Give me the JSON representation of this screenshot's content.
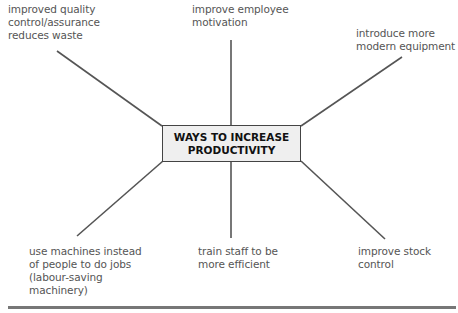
{
  "center": {
    "line1": "WAYS TO INCREASE",
    "line2": "PRODUCTIVITY"
  },
  "branches": [
    {
      "id": "top-left",
      "lines": [
        "improved quality",
        "control/assurance",
        "reduces waste"
      ]
    },
    {
      "id": "top-center",
      "lines": [
        "improve employee",
        "motivation"
      ]
    },
    {
      "id": "top-right",
      "lines": [
        "introduce more",
        "modern equipment"
      ]
    },
    {
      "id": "bottom-left",
      "lines": [
        "use machines instead",
        "of people to do jobs",
        "(labour-saving",
        "machinery)"
      ]
    },
    {
      "id": "bottom-center",
      "lines": [
        "train staff to be",
        "more efficient"
      ]
    },
    {
      "id": "bottom-right",
      "lines": [
        "improve stock",
        "control"
      ]
    }
  ],
  "colors": {
    "line": "#555555",
    "box_fill": "#efefef",
    "rule": "#777777"
  }
}
